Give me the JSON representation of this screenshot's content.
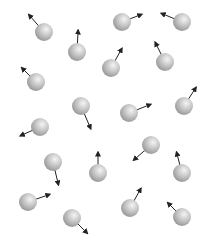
{
  "diagram": {
    "title": "",
    "sphere_radius": 9,
    "colors": {
      "background": "#ffffff",
      "sphere_highlight": "#f4f4f4",
      "sphere_mid": "#c8c8c8",
      "sphere_shadow": "#8e8e8e",
      "arrow": "#222222"
    },
    "molecules": [
      {
        "x": 44,
        "y": 32,
        "vx": -14,
        "vy": -16
      },
      {
        "x": 77,
        "y": 52,
        "vx": 1,
        "vy": -20
      },
      {
        "x": 122,
        "y": 22,
        "vx": 18,
        "vy": -7
      },
      {
        "x": 182,
        "y": 22,
        "vx": -19,
        "vy": -8
      },
      {
        "x": 36,
        "y": 82,
        "vx": -13,
        "vy": -13
      },
      {
        "x": 111,
        "y": 68,
        "vx": 10,
        "vy": -18
      },
      {
        "x": 165,
        "y": 62,
        "vx": -9,
        "vy": -18
      },
      {
        "x": 81,
        "y": 106,
        "vx": 9,
        "vy": 21
      },
      {
        "x": 129,
        "y": 113,
        "vx": 20,
        "vy": -8
      },
      {
        "x": 184,
        "y": 106,
        "vx": 11,
        "vy": -17
      },
      {
        "x": 40,
        "y": 127,
        "vx": -18,
        "vy": 8
      },
      {
        "x": 151,
        "y": 145,
        "vx": -16,
        "vy": 14
      },
      {
        "x": 53,
        "y": 162,
        "vx": 5,
        "vy": 21
      },
      {
        "x": 98,
        "y": 173,
        "vx": 0,
        "vy": -19
      },
      {
        "x": 182,
        "y": 173,
        "vx": -5,
        "vy": -19
      },
      {
        "x": 28,
        "y": 202,
        "vx": 20,
        "vy": -7
      },
      {
        "x": 130,
        "y": 208,
        "vx": 10,
        "vy": -18
      },
      {
        "x": 72,
        "y": 218,
        "vx": 14,
        "vy": 14
      },
      {
        "x": 182,
        "y": 217,
        "vx": -13,
        "vy": -13
      }
    ]
  }
}
